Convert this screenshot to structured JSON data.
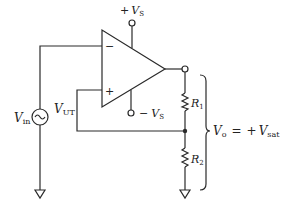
{
  "diagram": {
    "type": "circuit-schematic",
    "components": {
      "opamp": {
        "inverting_sign": "−",
        "noninverting_sign": "+"
      },
      "supply_positive": {
        "sign": "+",
        "symbol": "V",
        "subscript": "S"
      },
      "supply_negative": {
        "sign": "−",
        "symbol": "V",
        "subscript": "S"
      },
      "source": {
        "symbol": "V",
        "subscript": "in",
        "type": "AC source"
      },
      "threshold": {
        "symbol": "V",
        "subscript": "UT"
      },
      "r1": {
        "symbol": "R",
        "subscript": "1"
      },
      "r2": {
        "symbol": "R",
        "subscript": "2"
      },
      "output": {
        "symbol": "V",
        "subscript": "o",
        "equals": "=",
        "value_sign": "+",
        "value_symbol": "V",
        "value_subscript": "sat"
      }
    },
    "colors": {
      "line": "#2a2a2a",
      "background": "#ffffff"
    }
  }
}
